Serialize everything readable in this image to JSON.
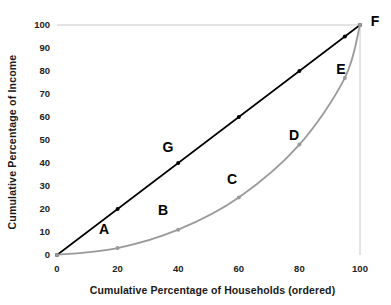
{
  "chart_data": {
    "type": "line",
    "title": "",
    "xlabel": "Cumulative Percentage of Households (ordered)",
    "ylabel": "Cumulative Percentage of Income",
    "xlim": [
      0,
      100
    ],
    "ylim": [
      0,
      100
    ],
    "xticks": [
      0,
      20,
      40,
      60,
      80,
      100
    ],
    "yticks": [
      0,
      10,
      20,
      30,
      40,
      50,
      60,
      70,
      80,
      90,
      100
    ],
    "grid": "light gridline at y=100 and x=100 only",
    "legend": "none",
    "series": [
      {
        "name": "Line of Perfect Equality",
        "color": "#000000",
        "x": [
          0,
          20,
          40,
          60,
          80,
          95,
          100
        ],
        "values": [
          0,
          20,
          40,
          60,
          80,
          95,
          100
        ]
      },
      {
        "name": "Lorenz Curve",
        "color": "#9a9a9a",
        "x": [
          0,
          20,
          40,
          60,
          80,
          95,
          100
        ],
        "values": [
          0,
          3,
          11,
          25,
          48,
          77,
          100
        ]
      }
    ],
    "annotations": [
      {
        "label": "A",
        "x": 20,
        "y": 3,
        "series": "Lorenz Curve"
      },
      {
        "label": "B",
        "x": 40,
        "y": 11,
        "series": "Lorenz Curve"
      },
      {
        "label": "C",
        "x": 60,
        "y": 25,
        "series": "Lorenz Curve"
      },
      {
        "label": "D",
        "x": 80,
        "y": 48,
        "series": "Lorenz Curve"
      },
      {
        "label": "E",
        "x": 95,
        "y": 77,
        "series": "Lorenz Curve"
      },
      {
        "label": "F",
        "x": 100,
        "y": 100,
        "series": "both"
      },
      {
        "label": "G",
        "x": 40,
        "y": 40,
        "series": "Line of Perfect Equality"
      }
    ]
  },
  "axes": {
    "x_title": "Cumulative Percentage of Households (ordered)",
    "y_title": "Cumulative Percentage of Income",
    "x_tick_labels": [
      "0",
      "20",
      "40",
      "60",
      "80",
      "100"
    ],
    "y_tick_labels": [
      "0",
      "10",
      "20",
      "30",
      "40",
      "50",
      "60",
      "70",
      "80",
      "90",
      "100"
    ]
  },
  "labels": {
    "a": "A",
    "b": "B",
    "c": "C",
    "d": "D",
    "e": "E",
    "f": "F",
    "g": "G"
  },
  "colors": {
    "equality_line": "#000000",
    "lorenz_curve": "#9a9a9a",
    "gridline": "#c8c8c8",
    "text": "#1a1a1a"
  }
}
